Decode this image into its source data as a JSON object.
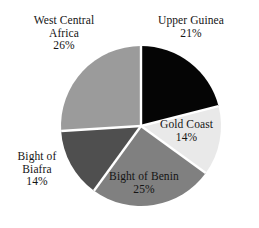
{
  "chart_data": {
    "type": "pie",
    "title": "",
    "subtitle": "",
    "xlabel": "",
    "ylabel": "",
    "legend_position": "none",
    "grid": false,
    "label_format": "name + percent",
    "start_angle_deg": 0,
    "direction": "clockwise",
    "categories": [
      "Upper Guinea",
      "Gold Coast",
      "Bight of Benin",
      "Bight of Biafra",
      "West Central Africa"
    ],
    "values": [
      21,
      14,
      25,
      14,
      26
    ],
    "units": "%",
    "slices": [
      {
        "label": "Upper Guinea",
        "label_line1": "Upper Guinea",
        "label_line2": "",
        "value": 21,
        "percent_text": "21%",
        "color": "#050505",
        "start_deg": 0,
        "end_deg": 75.6
      },
      {
        "label": "Gold Coast",
        "label_line1": "Gold Coast",
        "label_line2": "",
        "value": 14,
        "percent_text": "14%",
        "color": "#e9e9e9",
        "start_deg": 75.6,
        "end_deg": 126.0
      },
      {
        "label": "Bight of Benin",
        "label_line1": "Bight of Benin",
        "label_line2": "",
        "value": 25,
        "percent_text": "25%",
        "color": "#808080",
        "start_deg": 126.0,
        "end_deg": 216.0
      },
      {
        "label": "Bight of Biafra",
        "label_line1": "Bight of",
        "label_line2": "Biafra",
        "value": 14,
        "percent_text": "14%",
        "color": "#4f4f4f",
        "start_deg": 216.0,
        "end_deg": 266.4
      },
      {
        "label": "West Central Africa",
        "label_line1": "West Central",
        "label_line2": "Africa",
        "value": 26,
        "percent_text": "26%",
        "color": "#9b9b9b",
        "start_deg": 266.4,
        "end_deg": 360.0
      }
    ],
    "geometry": {
      "center_x": 141,
      "center_y": 126,
      "radius": 80,
      "separator_color": "#ffffff",
      "separator_width": 2.4
    },
    "background_color": "#ffffff",
    "text_color": "#141414"
  }
}
